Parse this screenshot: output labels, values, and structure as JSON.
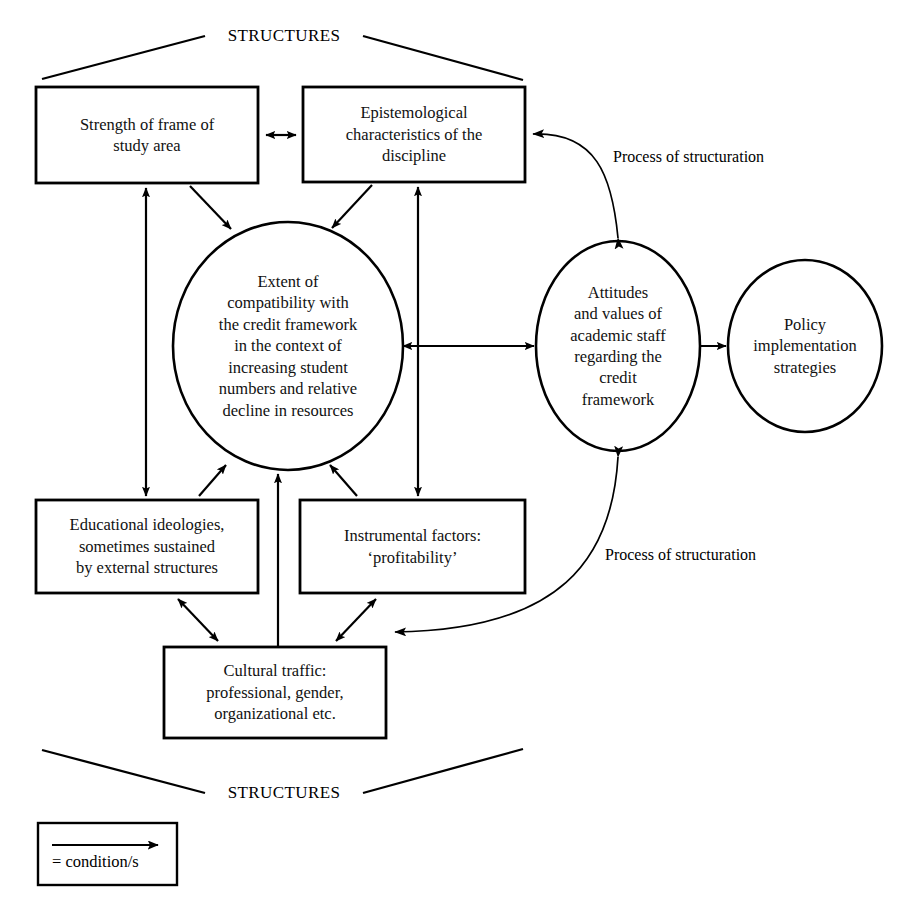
{
  "figure": {
    "type": "conceptual-flow-diagram",
    "background_color": "#ffffff",
    "line_color": "#000000",
    "width": 910,
    "height": 905
  },
  "brackets": {
    "top_label": "STRUCTURES",
    "bottom_label": "STRUCTURES"
  },
  "boxes": [
    {
      "id": "strength-of-frame",
      "label": "Strength of frame of\nstudy area",
      "x": 36,
      "y": 87,
      "w": 222,
      "h": 96
    },
    {
      "id": "epistemological-characteristics",
      "label": "Epistemological\ncharacteristics of the\ndiscipline",
      "x": 303,
      "y": 87,
      "w": 222,
      "h": 95
    },
    {
      "id": "educational-ideologies",
      "label": "Educational ideologies,\nsometimes sustained\nby external structures",
      "x": 36,
      "y": 500,
      "w": 222,
      "h": 93
    },
    {
      "id": "instrumental-factors",
      "label": "Instrumental factors:\n‘profitability’",
      "x": 300,
      "y": 500,
      "w": 225,
      "h": 93
    },
    {
      "id": "cultural-traffic",
      "label": "Cultural traffic:\nprofessional, gender,\norganizational etc.",
      "x": 164,
      "y": 647,
      "w": 222,
      "h": 91
    }
  ],
  "ellipses": [
    {
      "id": "extent-of-compatibility",
      "label": "Extent of\ncompatibility with\nthe credit framework\nin the context of\nincreasing student\nnumbers and relative\ndecline in resources",
      "cx": 288,
      "cy": 346,
      "rx": 115,
      "ry": 124
    },
    {
      "id": "attitudes-and-values",
      "label": "Attitudes\nand values of\nacademic staff\nregarding the\ncredit\nframework",
      "cx": 618,
      "cy": 346,
      "rx": 82,
      "ry": 105
    },
    {
      "id": "policy-implementation",
      "label": "Policy\nimplementation\nstrategies",
      "cx": 805,
      "cy": 346,
      "rx": 77,
      "ry": 86
    }
  ],
  "edge_labels": [
    {
      "id": "process-upper",
      "text": "Process of structuration",
      "x": 613,
      "y": 148
    },
    {
      "id": "process-lower",
      "text": "Process of structuration",
      "x": 605,
      "y": 546
    }
  ],
  "legend": {
    "arrow_meaning": "= condition/s",
    "box": {
      "x": 38,
      "y": 823,
      "w": 139,
      "h": 62
    }
  },
  "edges": [
    {
      "from": "strength-of-frame",
      "to": "epistemological-characteristics",
      "style": "double-headed"
    },
    {
      "from": "strength-of-frame",
      "to": "extent-of-compatibility",
      "style": "single"
    },
    {
      "from": "epistemological-characteristics",
      "to": "extent-of-compatibility",
      "style": "single"
    },
    {
      "from": "strength-of-frame",
      "to": "educational-ideologies",
      "style": "double-headed"
    },
    {
      "from": "epistemological-characteristics",
      "to": "instrumental-factors",
      "style": "double-headed"
    },
    {
      "from": "educational-ideologies",
      "to": "extent-of-compatibility",
      "style": "single"
    },
    {
      "from": "instrumental-factors",
      "to": "extent-of-compatibility",
      "style": "single"
    },
    {
      "from": "cultural-traffic",
      "to": "extent-of-compatibility",
      "style": "single"
    },
    {
      "from": "cultural-traffic",
      "to": "educational-ideologies",
      "style": "double-headed"
    },
    {
      "from": "cultural-traffic",
      "to": "instrumental-factors",
      "style": "double-headed"
    },
    {
      "from": "extent-of-compatibility",
      "to": "attitudes-and-values",
      "style": "double-headed"
    },
    {
      "from": "attitudes-and-values",
      "to": "policy-implementation",
      "style": "single"
    },
    {
      "from": "attitudes-and-values",
      "to": "epistemological-characteristics",
      "style": "curved",
      "label": "Process of structuration"
    },
    {
      "from": "instrumental-factors",
      "to": "attitudes-and-values",
      "style": "curved",
      "label": "Process of structuration"
    }
  ]
}
